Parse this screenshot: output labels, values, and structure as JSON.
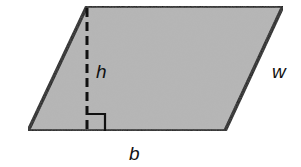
{
  "diagram": {
    "type": "parallelogram",
    "fill_color": "#b5b5b5",
    "stroke_color": "#111111",
    "vertices": {
      "top_left": [
        87,
        6
      ],
      "top_right": [
        283,
        6
      ],
      "bottom_right": [
        225,
        131
      ],
      "bottom_left": [
        28,
        131
      ]
    },
    "height_line": {
      "style": "dashed",
      "from": [
        87,
        6
      ],
      "to": [
        87,
        131
      ]
    },
    "right_angle_marker": {
      "x": 87,
      "y": 114,
      "size": 17
    },
    "labels": {
      "height": "h",
      "side": "w",
      "base": "b"
    }
  }
}
